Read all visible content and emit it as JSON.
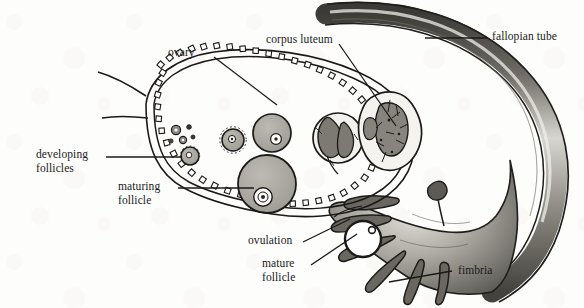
{
  "figure": {
    "type": "anatomical-illustration",
    "width": 584,
    "height": 308,
    "background_color": "#fdfdfc",
    "ink_color": "#1a1a1a",
    "shading_color": "#9a9a96"
  },
  "labels": {
    "ovary": "ovary",
    "corpus_luteum": "corpus luteum",
    "fallopian_tube": "fallopian tube",
    "developing_follicles_line1": "developing",
    "developing_follicles_line2": "follicles",
    "maturing_follicle_line1": "maturing",
    "maturing_follicle_line2": "follicle",
    "ovulation": "ovulation",
    "mature_follicle_line1": "mature",
    "mature_follicle_line2": "follicle",
    "fimbria": "fimbria"
  },
  "structures": [
    {
      "name": "ovary",
      "description": "oval organ bounded by beaded germinal epithelium"
    },
    {
      "name": "germinal-epithelium",
      "description": "double line with square cell beads along ovary border"
    },
    {
      "name": "primordial-follicles",
      "description": "cluster of tiny dark specks near upper left cortex"
    },
    {
      "name": "developing-follicles",
      "description": "small round shaded follicles increasing in size"
    },
    {
      "name": "maturing-follicle",
      "description": "large shaded follicle with ovum and antrum"
    },
    {
      "name": "mature-follicle",
      "description": "largest follicle at ovary margin before rupture"
    },
    {
      "name": "corpus-luteum",
      "description": "lobed glandular body with shaded folded interior"
    },
    {
      "name": "corpus-albicans",
      "description": "smaller regressing body adjacent to corpus luteum"
    },
    {
      "name": "released-ovum",
      "description": "ring-shaped ovum with nucleus dot, free at ovulation site"
    },
    {
      "name": "fallopian-tube",
      "description": "curved shaded tube arcing across upper right"
    },
    {
      "name": "infundibulum",
      "description": "funnel-shaped tube opening"
    },
    {
      "name": "fimbria",
      "description": "finger-like projections fringing the infundibulum"
    }
  ]
}
